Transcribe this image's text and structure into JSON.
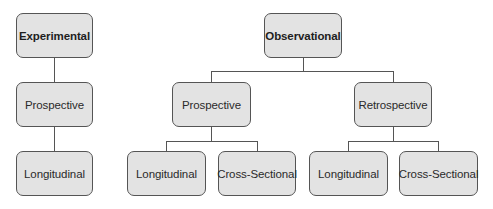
{
  "diagram": {
    "nodes": [
      {
        "id": "experimental",
        "label": "Experimental",
        "bold": true
      },
      {
        "id": "exp-prospective",
        "label": "Prospective"
      },
      {
        "id": "exp-longitudinal",
        "label": "Longitudinal"
      },
      {
        "id": "observational",
        "label": "Observational",
        "bold": true
      },
      {
        "id": "obs-prospective",
        "label": "Prospective"
      },
      {
        "id": "obs-retrospective",
        "label": "Retrospective"
      },
      {
        "id": "obs-pro-longitudinal",
        "label": "Longitudinal"
      },
      {
        "id": "obs-pro-cross-sectional",
        "label": "Cross-Sectional"
      },
      {
        "id": "obs-retro-longitudinal",
        "label": "Longitudinal"
      },
      {
        "id": "obs-retro-cross-sectional",
        "label": "Cross-Sectional"
      }
    ],
    "edges": [
      [
        "experimental",
        "exp-prospective"
      ],
      [
        "exp-prospective",
        "exp-longitudinal"
      ],
      [
        "observational",
        "obs-prospective"
      ],
      [
        "observational",
        "obs-retrospective"
      ],
      [
        "obs-prospective",
        "obs-pro-longitudinal"
      ],
      [
        "obs-prospective",
        "obs-pro-cross-sectional"
      ],
      [
        "obs-retrospective",
        "obs-retro-longitudinal"
      ],
      [
        "obs-retrospective",
        "obs-retro-cross-sectional"
      ]
    ],
    "colors": {
      "box_fill": "#e3e3e3",
      "box_border": "#555555",
      "line": "#555555"
    }
  }
}
